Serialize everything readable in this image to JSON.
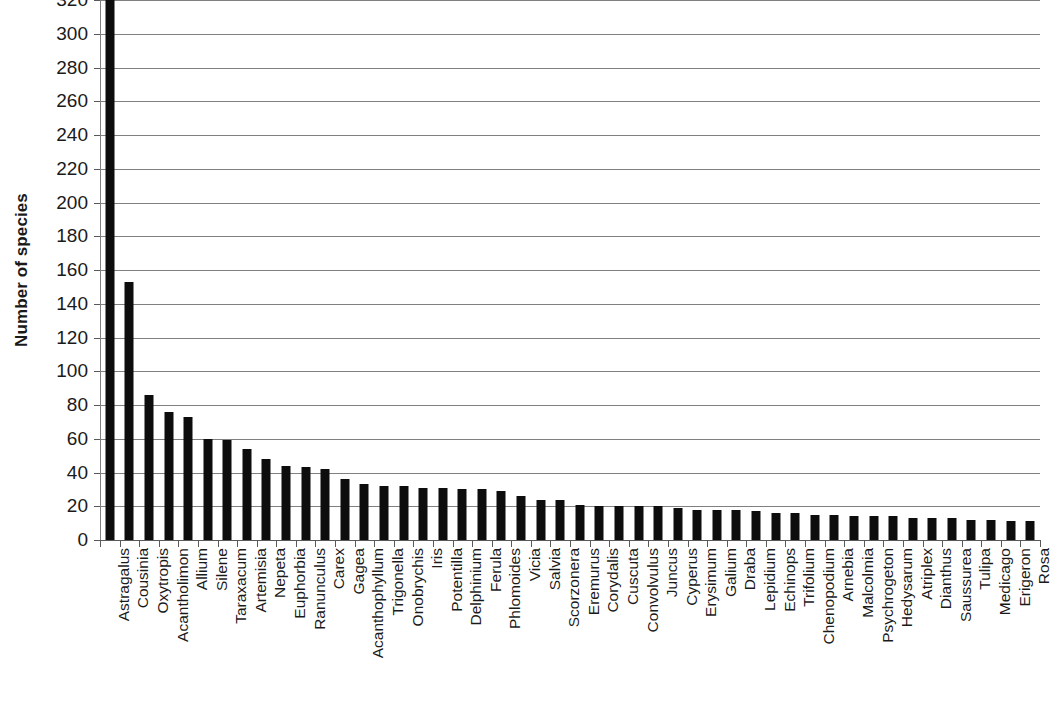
{
  "chart_data": {
    "type": "bar",
    "title": "",
    "xlabel": "",
    "ylabel": "Number of species",
    "ylim": [
      0,
      320
    ],
    "ytick_step": 20,
    "yticks": [
      0,
      20,
      40,
      60,
      80,
      100,
      120,
      140,
      160,
      180,
      200,
      220,
      240,
      260,
      280,
      300,
      320
    ],
    "grid": true,
    "legend": false,
    "bar_color": "#0d0d0d",
    "gridline_color": "#808080",
    "categories": [
      "Astragalus",
      "Cousinia",
      "Oxytropis",
      "Acantholimon",
      "Allium",
      "Silene",
      "Taraxacum",
      "Artemisia",
      "Nepeta",
      "Euphorbia",
      "Ranunculus",
      "Carex",
      "Gagea",
      "Acanthophyllum",
      "Trigonella",
      "Onobrychis",
      "Iris",
      "Potentilla",
      "Delphinium",
      "Ferula",
      "Phlomoides",
      "Vicia",
      "Salvia",
      "Scorzonera",
      "Eremurus",
      "Corydalis",
      "Cuscuta",
      "Convolvulus",
      "Juncus",
      "Cyperus",
      "Erysimum",
      "Galium",
      "Draba",
      "Lepidium",
      "Echinops",
      "Trifolium",
      "Chenopodium",
      "Arnebia",
      "Malcolmia",
      "Psychrogeton",
      "Hedysarum",
      "Atriplex",
      "Dianthus",
      "Saussurea",
      "Tulipa",
      "Medicago",
      "Erigeron",
      "Rosa"
    ],
    "values": [
      320,
      153,
      86,
      76,
      73,
      60,
      59,
      54,
      48,
      44,
      43,
      42,
      36,
      33,
      32,
      32,
      31,
      31,
      30,
      30,
      29,
      26,
      24,
      24,
      21,
      20,
      20,
      20,
      20,
      19,
      18,
      18,
      18,
      17,
      16,
      16,
      15,
      15,
      14,
      14,
      14,
      13,
      13,
      13,
      12,
      12,
      11,
      11
    ]
  }
}
